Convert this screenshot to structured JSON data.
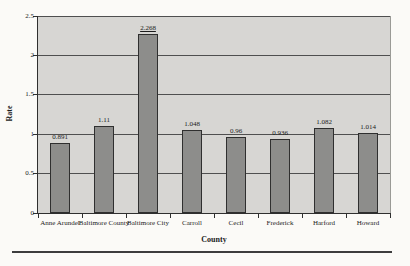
{
  "chart_data": {
    "type": "bar",
    "title": "",
    "xlabel": "County",
    "ylabel": "Rate",
    "categories": [
      "Anne Arundel",
      "Baltimore County",
      "Baltimore City",
      "Carroll",
      "Cecil",
      "Frederick",
      "Harford",
      "Howard"
    ],
    "values": [
      0.891,
      1.11,
      2.268,
      1.048,
      0.96,
      0.936,
      1.082,
      1.014
    ],
    "value_labels": [
      "0.891",
      "1.11",
      "2.268",
      "1.048",
      "0.96",
      "0.936",
      "1.082",
      "1.014"
    ],
    "underlined_value_index": 2,
    "ylim": [
      0,
      2.5
    ],
    "yticks": [
      0,
      0.5,
      1,
      1.5,
      2,
      2.5
    ],
    "ytick_labels": [
      "0",
      "0.5",
      "1",
      "1.5",
      "2",
      "2.5"
    ],
    "grid": true,
    "legend": "none",
    "colors": {
      "bar_fill": "#8d8d8b",
      "bar_border": "#2f2f2f",
      "plot_background": "#d7d6d3",
      "gridline": "#4f4f4f",
      "axis": "#2f2f2f",
      "text": "#1c1c1c",
      "page_background": "#fbfaf7",
      "bottom_rule": "#3d3d3d"
    }
  }
}
